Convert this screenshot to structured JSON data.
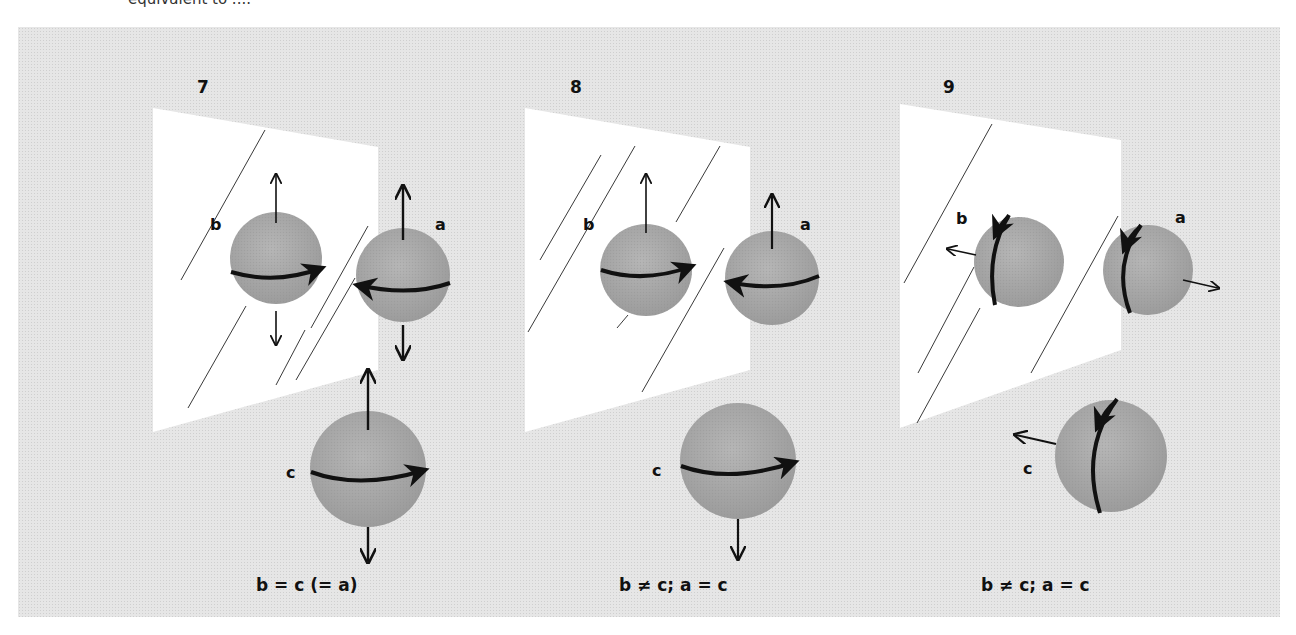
{
  "header": {
    "cut_text": "equivalent to ...."
  },
  "panels": [
    {
      "number": "7",
      "labels": {
        "a": "a",
        "b": "b",
        "c": "c"
      },
      "caption": "b = c (= a)"
    },
    {
      "number": "8",
      "labels": {
        "a": "a",
        "b": "b",
        "c": "c"
      },
      "caption": "b ≠ c; a = c"
    },
    {
      "number": "9",
      "labels": {
        "a": "a",
        "b": "b",
        "c": "c"
      },
      "caption": "b ≠ c; a = c"
    }
  ],
  "colors": {
    "plate": "#e6e6e6",
    "mirror": "#ffffff",
    "sphere": "#a8a8a8",
    "ink": "#111111"
  }
}
